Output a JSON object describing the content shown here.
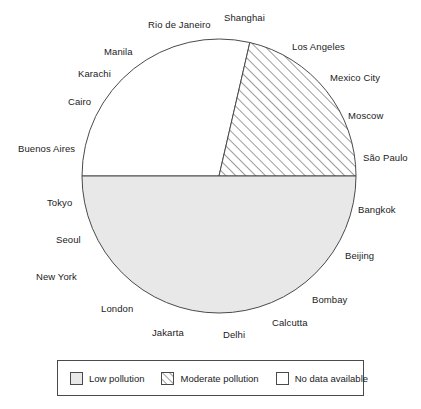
{
  "chart_data": {
    "type": "pie",
    "title": "",
    "subtitle": "",
    "xlabel": "",
    "ylabel": "",
    "grid": false,
    "legend_position": "bottom",
    "center": {
      "cx": 219,
      "cy": 176,
      "r": 137
    },
    "slices": [
      {
        "label": "Low pollution",
        "value": 50,
        "fill": "#e8e8e8",
        "pattern": "solid",
        "start_angle_deg": 180,
        "end_angle_deg": 360
      },
      {
        "label": "Moderate pollution",
        "value": 21,
        "fill": "#ffffff",
        "pattern": "diagonal-hatch",
        "start_angle_deg": 0,
        "end_angle_deg": 77
      },
      {
        "label": "No data available",
        "value": 29,
        "fill": "#ffffff",
        "pattern": "none",
        "start_angle_deg": 77,
        "end_angle_deg": 180
      }
    ],
    "annotations": [
      {
        "text": "Rio de Janeiro",
        "x": 148,
        "y": 19,
        "anchor": "start"
      },
      {
        "text": "Shanghai",
        "x": 224,
        "y": 12,
        "anchor": "start"
      },
      {
        "text": "Los Angeles",
        "x": 292,
        "y": 41,
        "anchor": "start"
      },
      {
        "text": "Manila",
        "x": 104,
        "y": 46,
        "anchor": "start"
      },
      {
        "text": "Karachi",
        "x": 78,
        "y": 68,
        "anchor": "start"
      },
      {
        "text": "Mexico City",
        "x": 330,
        "y": 72,
        "anchor": "start"
      },
      {
        "text": "Cairo",
        "x": 68,
        "y": 96,
        "anchor": "start"
      },
      {
        "text": "Moscow",
        "x": 348,
        "y": 110,
        "anchor": "start"
      },
      {
        "text": "Buenos Aires",
        "x": 18,
        "y": 143,
        "anchor": "start"
      },
      {
        "text": "São Paulo",
        "x": 363,
        "y": 152,
        "anchor": "start"
      },
      {
        "text": "Tokyo",
        "x": 47,
        "y": 197,
        "anchor": "start"
      },
      {
        "text": "Bangkok",
        "x": 358,
        "y": 204,
        "anchor": "start"
      },
      {
        "text": "Seoul",
        "x": 56,
        "y": 234,
        "anchor": "start"
      },
      {
        "text": "Beijing",
        "x": 345,
        "y": 250,
        "anchor": "start"
      },
      {
        "text": "New York",
        "x": 36,
        "y": 271,
        "anchor": "start"
      },
      {
        "text": "Bombay",
        "x": 312,
        "y": 294,
        "anchor": "start"
      },
      {
        "text": "London",
        "x": 101,
        "y": 303,
        "anchor": "start"
      },
      {
        "text": "Calcutta",
        "x": 272,
        "y": 317,
        "anchor": "start"
      },
      {
        "text": "Jakarta",
        "x": 152,
        "y": 327,
        "anchor": "start"
      },
      {
        "text": "Delhi",
        "x": 223,
        "y": 329,
        "anchor": "start"
      }
    ],
    "legend": [
      {
        "label": "Low pollution",
        "swatch": "solid-gray"
      },
      {
        "label": "Moderate pollution",
        "swatch": "hatched"
      },
      {
        "label": "No data available",
        "swatch": "white"
      }
    ]
  },
  "cities": [
    "Rio de Janeiro",
    "Shanghai",
    "Los Angeles",
    "Manila",
    "Karachi",
    "Mexico City",
    "Cairo",
    "Moscow",
    "Buenos Aires",
    "São Paulo",
    "Tokyo",
    "Bangkok",
    "Seoul",
    "Beijing",
    "New York",
    "Bombay",
    "London",
    "Calcutta",
    "Jakarta",
    "Delhi"
  ],
  "legend": {
    "items": [
      {
        "label": "Low pollution"
      },
      {
        "label": "Moderate pollution"
      },
      {
        "label": "No data available"
      }
    ]
  },
  "colors": {
    "low_pollution_fill": "#e8e8e8",
    "moderate_pollution_fill": "#ffffff",
    "no_data_fill": "#ffffff",
    "stroke": "#4a4a4a",
    "text": "#1b1b1b",
    "background": "#ffffff"
  }
}
